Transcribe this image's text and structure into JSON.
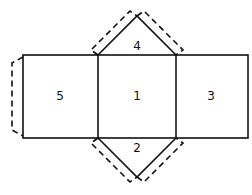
{
  "diagram": {
    "type": "prism-net",
    "faces": [
      {
        "id": "face-5",
        "label": "5"
      },
      {
        "id": "face-1",
        "label": "1"
      },
      {
        "id": "face-3",
        "label": "3"
      },
      {
        "id": "face-4",
        "label": "4"
      },
      {
        "id": "face-2",
        "label": "2"
      }
    ],
    "stroke_color": "#111111"
  }
}
